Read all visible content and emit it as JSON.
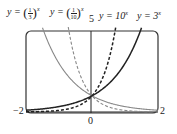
{
  "chart_data": {
    "type": "line",
    "title": "",
    "xlabel": "",
    "ylabel": "",
    "xlim": [
      -2,
      2
    ],
    "ylim": [
      0,
      5
    ],
    "grid": false,
    "tick_labels": {
      "x_left": "−2",
      "x_right": "2",
      "x_center": "0",
      "y_top": "5"
    },
    "series": [
      {
        "name": "y = (1/3)^x",
        "base": 0.3333,
        "style": "solid",
        "color": "#888888",
        "x": [
          -2,
          -1.5,
          -1,
          -0.5,
          0,
          0.5,
          1,
          1.5,
          2
        ],
        "y": [
          9,
          5.196,
          3,
          1.732,
          1,
          0.577,
          0.333,
          0.192,
          0.111
        ]
      },
      {
        "name": "y = (1/10)^x",
        "base": 0.1,
        "style": "dashed",
        "color": "#888888",
        "x": [
          -2,
          -1,
          -0.7,
          -0.5,
          0,
          0.5,
          1,
          2
        ],
        "y": [
          100,
          10,
          5.01,
          3.162,
          1,
          0.316,
          0.1,
          0.01
        ]
      },
      {
        "name": "y = 10^x",
        "base": 10,
        "style": "dashed",
        "color": "#222222",
        "x": [
          -2,
          -1,
          -0.5,
          0,
          0.5,
          0.7,
          1,
          2
        ],
        "y": [
          0.01,
          0.1,
          0.316,
          1,
          3.162,
          5.01,
          10,
          100
        ]
      },
      {
        "name": "y = 3^x",
        "base": 3,
        "style": "solid",
        "color": "#222222",
        "x": [
          -2,
          -1.5,
          -1,
          -0.5,
          0,
          0.5,
          1,
          1.5,
          2
        ],
        "y": [
          0.111,
          0.192,
          0.333,
          0.577,
          1,
          1.732,
          3,
          5.196,
          9
        ]
      }
    ]
  },
  "labels": {
    "third": {
      "prefix": "y = ",
      "num": "1",
      "den": "3",
      "exp": "x"
    },
    "tenth": {
      "prefix": "y = ",
      "num": "1",
      "den": "10",
      "exp": "x"
    },
    "ten": {
      "prefix": "y = 10",
      "exp": "x"
    },
    "three": {
      "prefix": "y = 3",
      "exp": "x"
    },
    "ytop": "5",
    "xleft": "−2",
    "xright": "2",
    "xcenter": "0"
  }
}
